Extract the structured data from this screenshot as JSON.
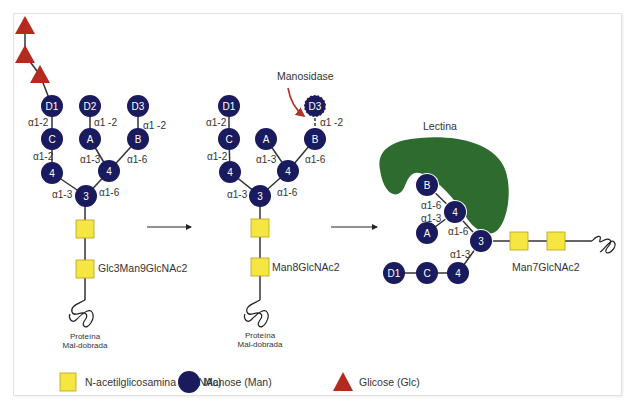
{
  "colors": {
    "mannose": "#1a1a5e",
    "glcnac": "#f5e642",
    "glcnac_stroke": "#b8a020",
    "glucose": "#b52a1c",
    "lectin": "#2e6b2e",
    "arrow_manosidase": "#b0352a",
    "edge": "#333333"
  },
  "structures": [
    {
      "name": "Glc3Man9GlcNAc2",
      "label": "Glc3Man9GlcNAc2",
      "protein_label_line1": "Proteína",
      "protein_label_line2": "Mal-dobrada",
      "glucose_count": 3,
      "nodes": [
        {
          "id": "D1",
          "label": "D1"
        },
        {
          "id": "D2",
          "label": "D2"
        },
        {
          "id": "D3",
          "label": "D3"
        },
        {
          "id": "C",
          "label": "C"
        },
        {
          "id": "A",
          "label": "A"
        },
        {
          "id": "B",
          "label": "B"
        },
        {
          "id": "4L",
          "label": "4"
        },
        {
          "id": "4R",
          "label": "4"
        },
        {
          "id": "3",
          "label": "3"
        }
      ],
      "linkages": {
        "D1_C": "α1-2",
        "D2_A": "α1 -2",
        "D3_B": "α1 -2",
        "C_4L": "α1-2",
        "A_4R": "α1-3",
        "B_4R": "α1-6",
        "4L_3": "α1-3",
        "4R_3": "α1-6"
      }
    },
    {
      "name": "Man8GlcNAc2",
      "label": "Man8GlcNAc2",
      "enzyme_label": "Manosidase",
      "protein_label_line1": "Proteína",
      "protein_label_line2": "Mal-dobrada",
      "nodes": [
        {
          "id": "D1",
          "label": "D1"
        },
        {
          "id": "D3",
          "label": "D3",
          "state": "being-removed"
        },
        {
          "id": "C",
          "label": "C"
        },
        {
          "id": "A",
          "label": "A"
        },
        {
          "id": "B",
          "label": "B"
        },
        {
          "id": "4L",
          "label": "4"
        },
        {
          "id": "4R",
          "label": "4"
        },
        {
          "id": "3",
          "label": "3"
        }
      ],
      "linkages": {
        "D1_C": "α1-2",
        "D3_B": "α1 -2",
        "C_4L": "α1-2",
        "A_4R": "α1-3",
        "B_4R": "α1-6",
        "4L_3": "α1-3",
        "4R_3": "α1-6"
      }
    },
    {
      "name": "Man7GlcNAc2",
      "label": "Man7GlcNAc2",
      "lectin_label": "Lectina",
      "nodes": [
        {
          "id": "B",
          "label": "B"
        },
        {
          "id": "4U",
          "label": "4"
        },
        {
          "id": "A",
          "label": "A"
        },
        {
          "id": "3",
          "label": "3"
        },
        {
          "id": "4D",
          "label": "4"
        },
        {
          "id": "C",
          "label": "C"
        },
        {
          "id": "D1",
          "label": "D1"
        }
      ],
      "linkages": {
        "B_4U": "α1-6",
        "A_4U": "α1-3",
        "4U_3": "α1-6",
        "4D_3": "α1-3"
      }
    }
  ],
  "legend": [
    {
      "shape": "square",
      "label": "N-acetilglicosamina (GlcNAc)"
    },
    {
      "shape": "circle",
      "label": "Manose (Man)"
    },
    {
      "shape": "triangle",
      "label": "Glicose (Glc)"
    }
  ]
}
